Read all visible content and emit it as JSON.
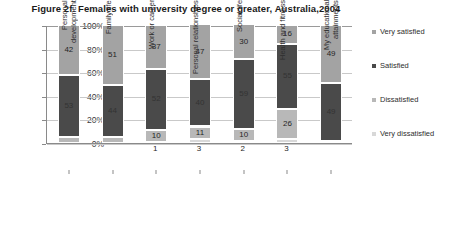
{
  "chart_data": {
    "type": "bar",
    "subtype": "stacked-100-percent-column",
    "title": "Figure 2f.  Females with university degree or greater, Australia,2004",
    "xlabel": "",
    "ylabel": "",
    "ylim": [
      0,
      100
    ],
    "yticks": [
      "0%",
      "20%",
      "40%",
      "60%",
      "80%",
      "100%"
    ],
    "ytick_values": [
      0,
      20,
      40,
      60,
      80,
      100
    ],
    "grid": true,
    "legend_position": "right",
    "categories": [
      "Personal development",
      "Family life",
      "Work or career",
      "Personal relationships",
      "Social life",
      "Health and fitness",
      "My educational attainments"
    ],
    "series": [
      {
        "name": "Very satisfied",
        "color": "#a3a3a3",
        "values": [
          42,
          51,
          37,
          47,
          30,
          16,
          49
        ]
      },
      {
        "name": "Satisfied",
        "color": "#4a4a4a",
        "values": [
          53,
          44,
          52,
          40,
          59,
          55,
          49
        ]
      },
      {
        "name": "Dissatisfied",
        "color": "#b8b8b8",
        "values": [
          5,
          5,
          10,
          11,
          10,
          26,
          2
        ]
      },
      {
        "name": "Very dissatisfied",
        "color": "#d8d8d8",
        "values": [
          0,
          0,
          1,
          3,
          2,
          3,
          0
        ]
      }
    ],
    "bar_labels": [
      {
        "category": "Personal development",
        "very_satisfied": "42",
        "satisfied": "53",
        "dissatisfied": "5",
        "very_dissatisfied": ""
      },
      {
        "category": "Family life",
        "very_satisfied": "51",
        "satisfied": "44",
        "dissatisfied": "5",
        "very_dissatisfied": ""
      },
      {
        "category": "Work or career",
        "very_satisfied": "37",
        "satisfied": "52",
        "dissatisfied": "10",
        "very_dissatisfied": "1"
      },
      {
        "category": "Personal relationships",
        "very_satisfied": "47",
        "satisfied": "40",
        "dissatisfied": "11",
        "very_dissatisfied": "3"
      },
      {
        "category": "Social life",
        "very_satisfied": "30",
        "satisfied": "59",
        "dissatisfied": "10",
        "very_dissatisfied": "2"
      },
      {
        "category": "Health and fitness",
        "very_satisfied": "16",
        "satisfied": "55",
        "dissatisfied": "26",
        "very_dissatisfied": "3"
      },
      {
        "category": "My educational attainments",
        "very_satisfied": "49",
        "satisfied": "49",
        "dissatisfied": "2",
        "very_dissatisfied": ""
      }
    ]
  },
  "legend": {
    "items": [
      {
        "label": "Very satisfied",
        "color": "#a3a3a3"
      },
      {
        "label": "Satisfied",
        "color": "#4a4a4a"
      },
      {
        "label": "Dissatisfied",
        "color": "#b8b8b8"
      },
      {
        "label": "Very dissatisfied",
        "color": "#d8d8d8"
      }
    ]
  }
}
